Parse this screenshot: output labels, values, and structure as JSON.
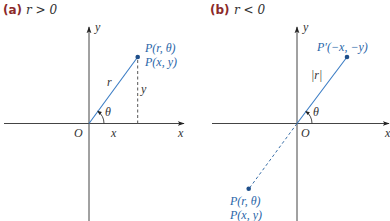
{
  "figure": {
    "panels": [
      {
        "id": "a",
        "label": "(a)",
        "condition": "r > 0",
        "axes": {
          "x_label": "x",
          "y_label": "y",
          "origin_label": "O"
        },
        "point": {
          "polar_label": "P(r, θ)",
          "cartesian_label": "P(x, y)",
          "quadrant": "I"
        },
        "segment_labels": {
          "radius": "r",
          "horizontal": "x",
          "vertical": "y"
        },
        "angle_label": "θ"
      },
      {
        "id": "b",
        "label": "(b)",
        "condition": "r < 0",
        "axes": {
          "x_label": "x",
          "y_label": "y",
          "origin_label": "O"
        },
        "reflected_point": {
          "label": "P′(−x, −y)",
          "quadrant": "I"
        },
        "point": {
          "polar_label": "P(r, θ)",
          "cartesian_label": "P(x, y)",
          "quadrant": "III"
        },
        "segment_labels": {
          "radius": "|r|"
        },
        "angle_label": "θ"
      }
    ],
    "colors": {
      "panel_label": "#8b2a2a",
      "point_label": "#2a66a8",
      "ray": "#3a7cc4",
      "point": "#1f4f8a",
      "axis": "#444444"
    }
  }
}
